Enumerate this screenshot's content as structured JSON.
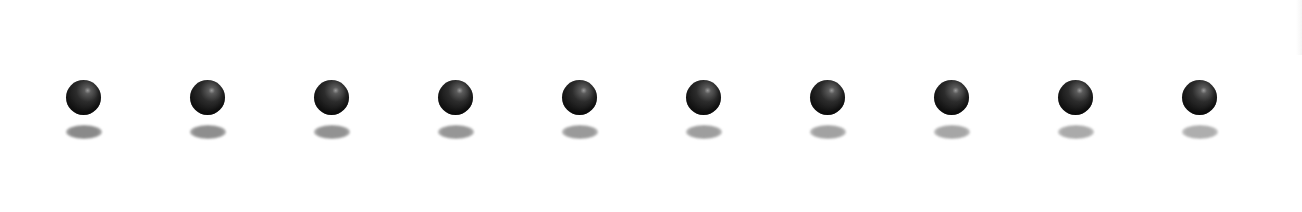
{
  "loader": {
    "kind": "bouncing-balls",
    "ball_color": "#161616",
    "highlight_color": "#9a9a9a",
    "items": [
      {
        "center_x": 84,
        "shadow_color": "#8a8a8a"
      },
      {
        "center_x": 208,
        "shadow_color": "#8e8e8e"
      },
      {
        "center_x": 332,
        "shadow_color": "#929292"
      },
      {
        "center_x": 456,
        "shadow_color": "#969696"
      },
      {
        "center_x": 580,
        "shadow_color": "#9a9a9a"
      },
      {
        "center_x": 704,
        "shadow_color": "#9e9e9e"
      },
      {
        "center_x": 828,
        "shadow_color": "#a2a2a2"
      },
      {
        "center_x": 952,
        "shadow_color": "#a6a6a6"
      },
      {
        "center_x": 1076,
        "shadow_color": "#aaaaaa"
      },
      {
        "center_x": 1200,
        "shadow_color": "#aeaeae"
      }
    ]
  }
}
